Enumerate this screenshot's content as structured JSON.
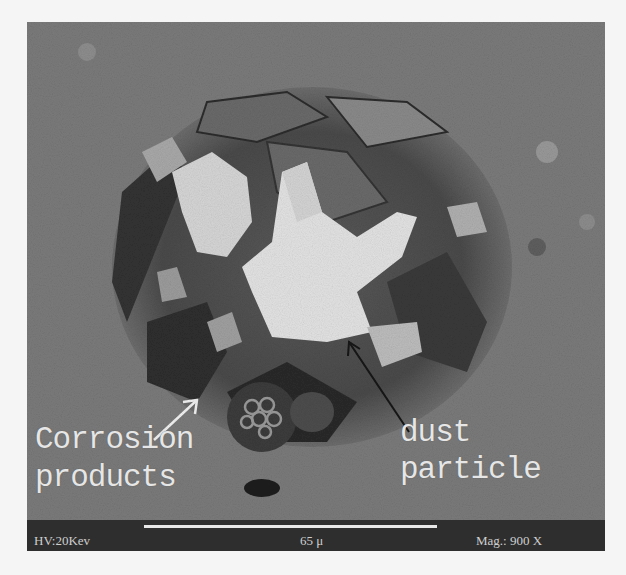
{
  "figure": {
    "type": "SEM micrograph",
    "annotations": [
      {
        "id": "corrosion",
        "lines": [
          "Corrosion",
          "products"
        ],
        "arrow_color": "#ffffff"
      },
      {
        "id": "dust",
        "lines": [
          "dust",
          "particle"
        ],
        "arrow_color": "#1a1a1a"
      }
    ],
    "info_bar": {
      "voltage": "HV:20Kev",
      "scale_label": "65 μ",
      "magnification": "Mag.: 900 X"
    },
    "colors": {
      "background": "#7a7a7a",
      "particle": "#e2e2e2",
      "pit_dark": "#3a3a3a",
      "info_bar": "#2e2e2e",
      "page": "#f5f5f5"
    }
  }
}
